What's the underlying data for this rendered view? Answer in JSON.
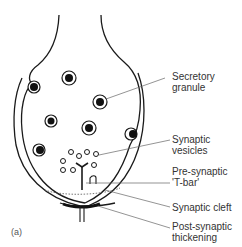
{
  "figure": {
    "panel_label": "(a)",
    "labels": [
      {
        "id": "secretory-granule",
        "lines": [
          "Secretory",
          "granule"
        ]
      },
      {
        "id": "synaptic-vesicles",
        "lines": [
          "Synaptic",
          "vesicles"
        ]
      },
      {
        "id": "pre-synaptic-t-bar",
        "lines": [
          "Pre-synaptic",
          "'T-bar'"
        ]
      },
      {
        "id": "synaptic-cleft",
        "lines": [
          "Synaptic cleft"
        ]
      },
      {
        "id": "post-synaptic-thickening",
        "lines": [
          "Post-synaptic",
          "thickening"
        ]
      }
    ]
  },
  "colors": {
    "line": "#1a1a1a",
    "leader": "#666666",
    "text": "#333333"
  }
}
